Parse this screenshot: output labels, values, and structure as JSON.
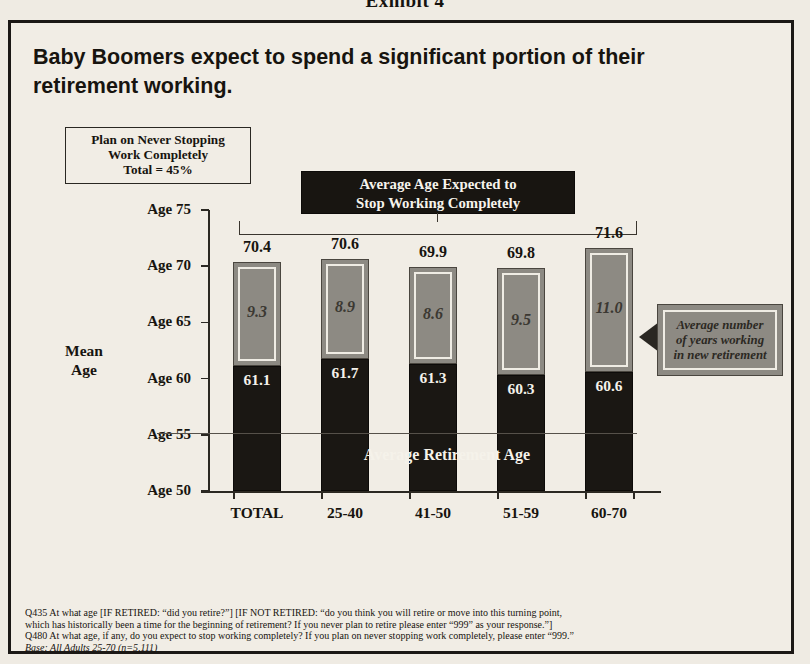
{
  "exhibit": {
    "label": "Exhibit 4"
  },
  "headline": {
    "line1": "Baby Boomers expect to spend a significant portion of their",
    "line2": "retirement working."
  },
  "never_stop_box": {
    "line1": "Plan on Never Stopping",
    "line2": "Work Completely",
    "line3": "Total = 45%"
  },
  "banner": {
    "line1": "Average Age Expected to",
    "line2": "Stop Working Completely"
  },
  "axis": {
    "y_title_line1": "Mean",
    "y_title_line2": "Age",
    "y_ticks": [
      "Age 75",
      "Age 70",
      "Age 65",
      "Age 60",
      "Age 55",
      "Age 50"
    ]
  },
  "annotations": {
    "avg_retirement_age": "Average Retirement Age",
    "right_callout_line1": "Average number",
    "right_callout_line2": "of years working",
    "right_callout_line3": "in new retirement"
  },
  "footnotes": {
    "line1": "Q435  At what age [IF RETIRED: “did you retire?”] [IF NOT RETIRED: “do you think you will retire or move into this turning point,",
    "line2": "which has historically been a time for the beginning of retirement?  If you never plan to retire please enter “999” as your response.”]",
    "line3": "Q480 At what age, if any, do you expect to stop working completely?  If you plan on never stopping work completely, please enter “999.”",
    "base": "Base: All Adults 25-70 (n=5,111)"
  },
  "colors": {
    "background": "#efebe3",
    "bar_dark": "#1a1713",
    "bar_gray": "#8d8a83",
    "banner_bg": "#181511",
    "text": "#17140f"
  },
  "chart_data": {
    "type": "bar",
    "title": "Baby Boomers expect to spend a significant portion of their retirement working.",
    "subtitle": "Average Age Expected to Stop Working Completely",
    "xlabel": "",
    "ylabel": "Mean Age",
    "ylim": [
      50,
      75
    ],
    "ytick_values": [
      50,
      55,
      60,
      65,
      70,
      75
    ],
    "ytick_labels": [
      "Age 50",
      "Age 55",
      "Age 60",
      "Age 65",
      "Age 70",
      "Age 75"
    ],
    "grid": false,
    "legend": "none",
    "stacked": true,
    "categories": [
      "TOTAL",
      "25-40",
      "41-50",
      "51-59",
      "60-70"
    ],
    "series": [
      {
        "name": "Average Retirement Age",
        "color": "#1a1713",
        "values": [
          61.1,
          61.7,
          61.3,
          60.3,
          60.6
        ],
        "labels": [
          "61.1",
          "61.7",
          "61.3",
          "60.3",
          "60.6"
        ]
      },
      {
        "name": "Average number of years working in new retirement",
        "color": "#8d8a83",
        "values": [
          9.3,
          8.9,
          8.6,
          9.5,
          11.0
        ],
        "labels": [
          "9.3",
          "8.9",
          "8.6",
          "9.5",
          "11.0"
        ]
      }
    ],
    "totals": [
      70.4,
      70.6,
      69.9,
      69.8,
      71.6
    ],
    "total_labels": [
      "70.4",
      "70.6",
      "69.9",
      "69.8",
      "71.6"
    ],
    "annotations": [
      "Plan on Never Stopping Work Completely Total = 45%",
      "Average Retirement Age",
      "Average number of years working in new retirement"
    ]
  }
}
